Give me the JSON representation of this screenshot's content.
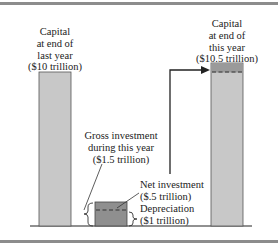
{
  "diagram": {
    "labels": {
      "capital_last_year": [
        "Capital",
        "at end of",
        "last year",
        "($10 trillion)"
      ],
      "capital_this_year": [
        "Capital",
        "at end of",
        "this year",
        "($10.5 trillion)"
      ],
      "gross_investment": [
        "Gross investment",
        "during this year",
        "($1.5 trillion)"
      ],
      "net_investment": [
        "Net investment",
        "($.5 trillion)"
      ],
      "depreciation": [
        "Depreciation",
        "($1 trillion)"
      ]
    },
    "values": {
      "capital_last_year": 10,
      "capital_this_year": 10.5,
      "gross_investment": 1.5,
      "net_investment": 0.5,
      "depreciation": 1,
      "unit": "trillion dollars"
    },
    "colors": {
      "capital_bar": "#c8c8c8",
      "investment_bar": "#8f8f8f",
      "net_cap_band": "#9a9a9a",
      "line": "#222222",
      "rule": "#8c8c8c"
    }
  }
}
